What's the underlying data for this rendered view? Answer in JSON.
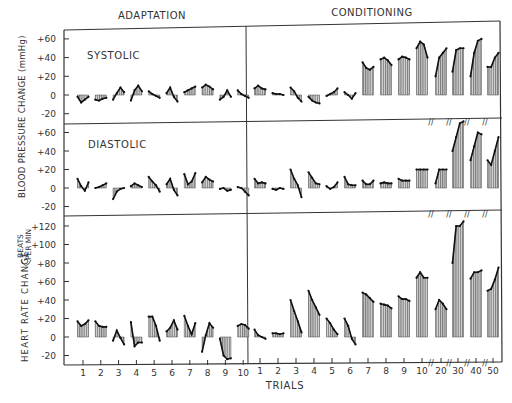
{
  "chart_data": {
    "type": "bar",
    "title": "",
    "section_labels": [
      "ADAPTATION",
      "CONDITIONING"
    ],
    "xlabel": "TRIALS",
    "x_ticks_adaptation": [
      "1",
      "2",
      "3",
      "4",
      "5",
      "6",
      "7",
      "8",
      "9",
      "10"
    ],
    "x_ticks_conditioning": [
      "1",
      "2",
      "3",
      "4",
      "5",
      "6",
      "7",
      "8",
      "9",
      "10",
      "20",
      "30",
      "40",
      "50"
    ],
    "y_axis_group_labels": {
      "blood_pressure": "BLOOD PRESSURE CHANGE (mmHg)",
      "heart_rate": "HEART RATE CHANGE",
      "heart_rate_units": [
        "BEATS",
        "PER MIN"
      ]
    },
    "panels": [
      {
        "name": "SYSTOLIC",
        "ylabel": "BLOOD PRESSURE CHANGE (mmHg)",
        "ylim": [
          -20,
          60
        ],
        "yticks": [
          "+60",
          "+40",
          "+20",
          "0",
          "-20"
        ],
        "adaptation": [
          [
            -2,
            -8,
            -5,
            -2
          ],
          [
            -5,
            -6,
            -4,
            -3
          ],
          [
            -5,
            2,
            8,
            3
          ],
          [
            -6,
            5,
            10,
            4
          ],
          [
            4,
            1,
            -1,
            -3
          ],
          [
            2,
            8,
            -2,
            -7
          ],
          [
            3,
            5,
            7,
            9
          ],
          [
            8,
            11,
            9,
            6
          ],
          [
            -5,
            -2,
            5,
            -2
          ],
          [
            5,
            1,
            -1,
            -3
          ]
        ],
        "conditioning": [
          [
            7,
            10,
            7,
            6
          ],
          [
            2,
            1,
            1,
            0
          ],
          [
            8,
            4,
            -3,
            -7
          ],
          [
            -2,
            -6,
            -8,
            -9
          ],
          [
            -1,
            1,
            3,
            7
          ],
          [
            3,
            0,
            -4,
            2
          ],
          [
            35,
            29,
            27,
            30
          ],
          [
            38,
            40,
            37,
            32
          ],
          [
            38,
            41,
            40,
            38
          ],
          [
            50,
            57,
            54,
            40
          ],
          [
            20,
            40,
            45,
            50
          ],
          [
            25,
            48,
            50,
            50
          ],
          [
            20,
            45,
            58,
            60
          ],
          [
            30,
            30,
            40,
            45
          ]
        ]
      },
      {
        "name": "DIASTOLIC",
        "ylabel": "",
        "ylim": [
          -20,
          60
        ],
        "yticks": [
          "+60",
          "+40",
          "+20",
          "0",
          "-20"
        ],
        "adaptation": [
          [
            10,
            2,
            -3,
            6
          ],
          [
            0,
            1,
            3,
            5
          ],
          [
            -12,
            -4,
            -1,
            0
          ],
          [
            2,
            5,
            3,
            1
          ],
          [
            12,
            7,
            3,
            -4
          ],
          [
            4,
            10,
            -2,
            -8
          ],
          [
            15,
            4,
            7,
            16
          ],
          [
            6,
            12,
            9,
            7
          ],
          [
            -1,
            0,
            -3,
            -2
          ],
          [
            1,
            0,
            -4,
            -8
          ]
        ],
        "conditioning": [
          [
            10,
            5,
            6,
            5
          ],
          [
            -1,
            -2,
            0,
            -1
          ],
          [
            20,
            10,
            3,
            -10
          ],
          [
            17,
            11,
            5,
            4
          ],
          [
            2,
            -1,
            1,
            6
          ],
          [
            12,
            4,
            3,
            3
          ],
          [
            8,
            4,
            4,
            8
          ],
          [
            5,
            6,
            5,
            5
          ],
          [
            10,
            8,
            8,
            8
          ],
          [
            20,
            20,
            20,
            20
          ],
          [
            5,
            20,
            20,
            20
          ],
          [
            40,
            55,
            70,
            72
          ],
          [
            30,
            45,
            60,
            58
          ],
          [
            30,
            25,
            40,
            55
          ]
        ]
      },
      {
        "name": "HEART RATE",
        "ylabel": "HEART RATE CHANGE (BEATS PER MIN)",
        "ylim": [
          -20,
          120
        ],
        "yticks": [
          "+120",
          "+100",
          "+80",
          "+60",
          "+40",
          "+20",
          "0",
          "-20"
        ],
        "adaptation": [
          [
            17,
            12,
            14,
            18
          ],
          [
            17,
            12,
            11,
            11
          ],
          [
            -4,
            7,
            -1,
            -8
          ],
          [
            16,
            -10,
            -6,
            -6
          ],
          [
            22,
            22,
            12,
            -4
          ],
          [
            6,
            10,
            18,
            8
          ],
          [
            23,
            12,
            3,
            15
          ],
          [
            -16,
            2,
            15,
            10
          ],
          [
            -2,
            -20,
            -24,
            -23
          ],
          [
            12,
            14,
            13,
            9
          ]
        ],
        "conditioning": [
          [
            8,
            2,
            0,
            -2
          ],
          [
            4,
            4,
            3,
            4
          ],
          [
            40,
            28,
            17,
            5
          ],
          [
            50,
            40,
            32,
            24
          ],
          [
            20,
            15,
            8,
            3
          ],
          [
            20,
            12,
            -2,
            -8
          ],
          [
            48,
            46,
            42,
            38
          ],
          [
            36,
            35,
            34,
            31
          ],
          [
            44,
            41,
            41,
            39
          ],
          [
            64,
            70,
            64,
            64
          ],
          [
            30,
            40,
            36,
            30
          ],
          [
            80,
            120,
            120,
            125
          ],
          [
            63,
            70,
            70,
            72
          ],
          [
            50,
            52,
            62,
            75
          ]
        ]
      }
    ],
    "layout": {
      "grid": false,
      "legend": "none",
      "fill": "vertical hatching (grey)"
    }
  }
}
